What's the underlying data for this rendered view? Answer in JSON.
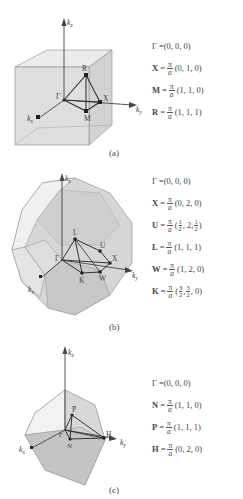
{
  "panels": [
    {
      "id": "a",
      "caption": "(a)",
      "lattice": "simple cubic",
      "axes": {
        "z": "k_z",
        "y": "k_y",
        "x": "k_x"
      },
      "points_labels": [
        "Γ",
        "R",
        "X",
        "M"
      ],
      "equations": [
        {
          "symbol": "Γ",
          "prefix": "",
          "value": "(0, 0, 0)"
        },
        {
          "symbol": "X",
          "prefix": "π/a",
          "value": "(0, 1, 0)"
        },
        {
          "symbol": "M",
          "prefix": "π/a",
          "value": "(1, 1, 0)"
        },
        {
          "symbol": "R",
          "prefix": "π/a",
          "value": "(1, 1, 1)"
        }
      ]
    },
    {
      "id": "b",
      "caption": "(b)",
      "lattice": "face-centered cubic",
      "axes": {
        "z": "k_z",
        "y": "k_y",
        "x": "k_x"
      },
      "points_labels": [
        "Γ",
        "L",
        "U",
        "X",
        "W",
        "K"
      ],
      "equations": [
        {
          "symbol": "Γ",
          "prefix": "",
          "value": "(0, 0, 0)"
        },
        {
          "symbol": "X",
          "prefix": "π/a",
          "value": "(0, 2, 0)"
        },
        {
          "symbol": "U",
          "prefix": "π/a",
          "value": "(1/2, 2, 1/2)"
        },
        {
          "symbol": "L",
          "prefix": "π/a",
          "value": "(1, 1, 1)"
        },
        {
          "symbol": "W",
          "prefix": "π/a",
          "value": "(1, 2, 0)"
        },
        {
          "symbol": "K",
          "prefix": "π/a",
          "value": "(3/2, 3/2, 0)"
        }
      ]
    },
    {
      "id": "c",
      "caption": "(c)",
      "lattice": "body-centered cubic",
      "axes": {
        "z": "k_z",
        "y": "k_y",
        "x": "k_x"
      },
      "points_labels": [
        "Γ",
        "P",
        "N",
        "H"
      ],
      "equations": [
        {
          "symbol": "Γ",
          "prefix": "",
          "value": "(0, 0, 0)"
        },
        {
          "symbol": "N",
          "prefix": "π/a",
          "value": "(1, 1, 0)"
        },
        {
          "symbol": "P",
          "prefix": "π/a",
          "value": "(1, 1, 1)"
        },
        {
          "symbol": "H",
          "prefix": "π/a",
          "value": "(0, 2, 0)"
        }
      ]
    }
  ],
  "labels": {
    "pi": "π",
    "a": "a",
    "eq": " = ",
    "kz": "k",
    "kz_sub": "z",
    "ky": "k",
    "ky_sub": "y",
    "kx": "k",
    "kx_sub": "x",
    "half": {
      "n": "1",
      "d": "2"
    },
    "three_half": {
      "n": "3",
      "d": "2"
    }
  }
}
